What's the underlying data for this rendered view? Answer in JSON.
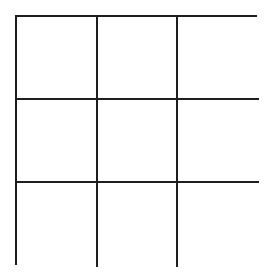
{
  "game": {
    "type": "tic-tac-toe",
    "rows": 3,
    "cols": 3,
    "line_color": "#1e1e1e",
    "background": "#ffffff",
    "cells": [
      [
        "",
        "",
        ""
      ],
      [
        "",
        "",
        ""
      ],
      [
        "",
        "",
        ""
      ]
    ]
  }
}
